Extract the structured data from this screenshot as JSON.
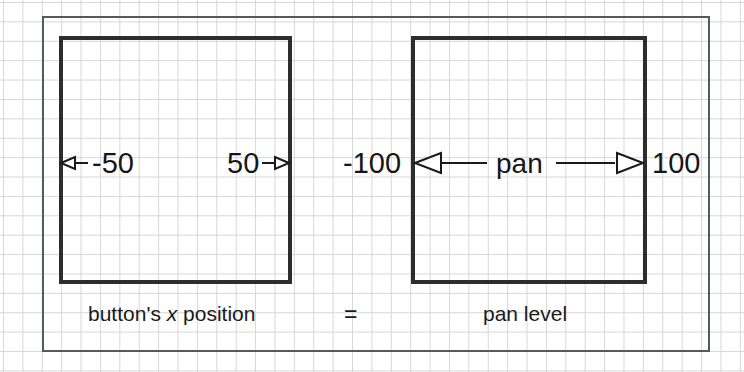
{
  "figure": {
    "background": "#ffffff",
    "grid_color": "#d6d6d6",
    "ink_color": "#2d2d2d",
    "frame_color": "#555a5e",
    "panels": [
      {
        "name": "button-x-position-panel",
        "left_value": "-50",
        "right_value": "50",
        "caption_prefix": "button's ",
        "caption_italic": "x",
        "caption_suffix": " position"
      },
      {
        "name": "pan-level-panel",
        "left_value": "-100",
        "right_value": "100",
        "span_label": "pan",
        "caption": "pan level"
      }
    ],
    "equals_sign": "=",
    "arrows": {
      "left_panel_left_arrow": "arrow-left-icon",
      "left_panel_right_arrow": "arrow-right-icon",
      "right_panel_left_arrow": "arrow-left-icon",
      "right_panel_right_arrow": "arrow-right-icon"
    }
  }
}
